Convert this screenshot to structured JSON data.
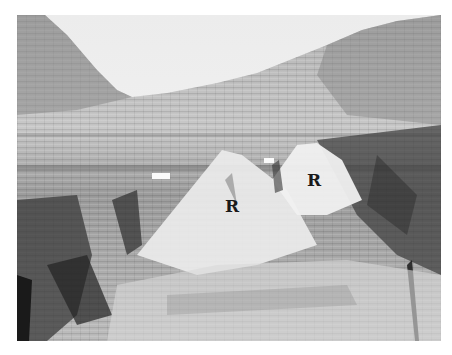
{
  "photo": {
    "description": "Black-and-white photograph of a stratified limestone cliff face with two triangular light-colored rock masses",
    "palette": {
      "sky": "#f0f0f0",
      "light_rock": "#e4e4e4",
      "mid_rock": "#a8a8a8",
      "dark_rock": "#3a3a3a",
      "label": "#1a1a1a"
    }
  },
  "labels": [
    {
      "text": "R",
      "x": 225,
      "y": 198
    },
    {
      "text": "R",
      "x": 307,
      "y": 172
    }
  ]
}
